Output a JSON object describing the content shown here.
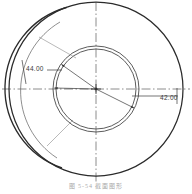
{
  "figure": {
    "caption": "图 5-54   截面图形"
  },
  "dimensions": [
    {
      "id": "left-radius",
      "label": "44.00",
      "kind": "radius-leader",
      "placement": "upper-left"
    },
    {
      "id": "right-radius",
      "label": "42.00",
      "kind": "radius-leader",
      "placement": "right"
    }
  ],
  "geometry": {
    "center": {
      "x": 96,
      "y": 89
    },
    "outer_circle_radius": 87,
    "outer_offset_arc_radius": 84,
    "inner_circle_outer_radius": 43,
    "inner_circle_inner_radius": 40,
    "centerline_style": "dash-dot"
  },
  "colors": {
    "ink": "#2b2b2b",
    "thin_ink": "#5f5f5f",
    "centerline": "#6e6e6e",
    "background": "#ffffff",
    "caption": "#7a7a7a"
  },
  "annotations": {
    "radius_leader_count": 3,
    "has_vertical_centerline": true,
    "has_horizontal_centerline": true
  }
}
